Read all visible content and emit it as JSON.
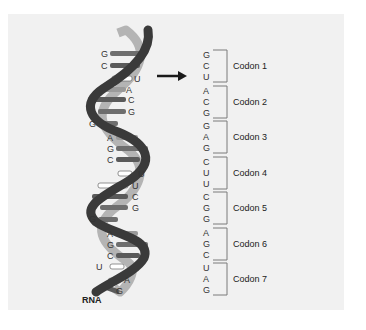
{
  "diagram": {
    "strand_label": "RNA",
    "helix_bases": [
      "G",
      "C",
      "U",
      "A",
      "C",
      "G",
      "G",
      "A",
      "G",
      "C",
      "U",
      "U",
      "C",
      "G",
      "G",
      "A",
      "G",
      "C",
      "U",
      "A",
      "G"
    ],
    "codons": [
      {
        "label": "Codon 1",
        "bases": [
          "G",
          "C",
          "U"
        ]
      },
      {
        "label": "Codon 2",
        "bases": [
          "A",
          "C",
          "G"
        ]
      },
      {
        "label": "Codon 3",
        "bases": [
          "G",
          "A",
          "G"
        ]
      },
      {
        "label": "Codon 4",
        "bases": [
          "C",
          "U",
          "U"
        ]
      },
      {
        "label": "Codon 5",
        "bases": [
          "C",
          "G",
          "G"
        ]
      },
      {
        "label": "Codon 6",
        "bases": [
          "A",
          "G",
          "C"
        ]
      },
      {
        "label": "Codon 7",
        "bases": [
          "U",
          "A",
          "G"
        ]
      }
    ],
    "colors": {
      "background_panel": "#f1f1f1",
      "backbone_dark": "#3a3a3a",
      "backbone_light": "#b4b4b4",
      "base_G": "#6e6e6e",
      "base_C": "#5a5a5a",
      "base_A": "#9a9a9a",
      "base_U": "#ffffff",
      "bracket": "#7a7a7a",
      "arrow": "#1a1a1a"
    }
  }
}
